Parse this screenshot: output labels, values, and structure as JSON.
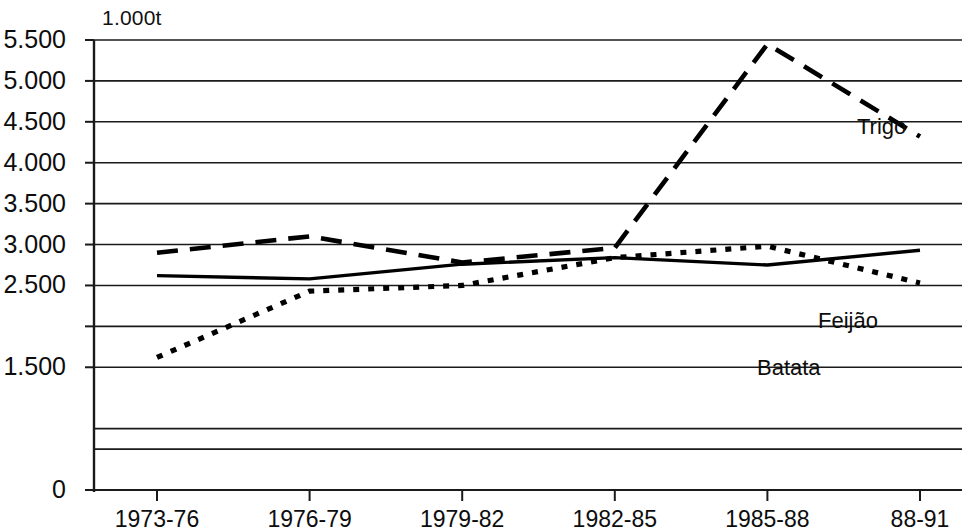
{
  "chart_data": {
    "type": "line",
    "title": "",
    "subtitle": "",
    "unit_label": "1.000t",
    "xlabel": "",
    "ylabel": "",
    "categories": [
      "1973-76",
      "1976-79",
      "1979-82",
      "1982-85",
      "1985-88",
      "88-91"
    ],
    "ylim": [
      0,
      5500
    ],
    "y_ticks": [
      0,
      1500,
      2000,
      2500,
      3000,
      3500,
      4000,
      4500,
      5000,
      5500
    ],
    "y_tick_labels": [
      "0",
      "1.500",
      "2.000",
      "2.500",
      "3.000",
      "3.500",
      "4.000",
      "4.500",
      "5.000",
      "5.500"
    ],
    "y_labeled_ticks": [
      "0",
      "1.500",
      "2.500",
      "3.000",
      "3.500",
      "4.000",
      "4.500",
      "5.000",
      "5.500"
    ],
    "extra_gridlines": [
      500,
      750
    ],
    "grid": true,
    "legend_position": "inline-annotations",
    "series": [
      {
        "name": "Trigo",
        "style": "dashed",
        "color": "#000000",
        "values": [
          2900,
          3100,
          2780,
          2960,
          5450,
          4320
        ]
      },
      {
        "name": "Feijão",
        "style": "solid",
        "color": "#000000",
        "values": [
          2620,
          2580,
          2760,
          2840,
          2750,
          2930
        ]
      },
      {
        "name": "Batata",
        "style": "dotted",
        "color": "#000000",
        "values": [
          1620,
          2430,
          2500,
          2840,
          2980,
          2530
        ]
      }
    ],
    "annotations": [
      {
        "text": "Trigo",
        "series": "Trigo"
      },
      {
        "text": "Feijão",
        "series": "Feijão"
      },
      {
        "text": "Batata",
        "series": "Batata"
      }
    ]
  }
}
